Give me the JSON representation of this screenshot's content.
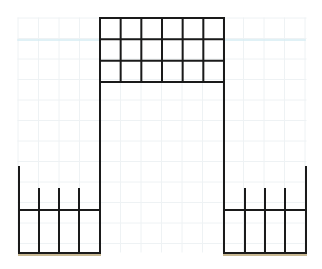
{
  "figure": {
    "colors": {
      "background": "#ffffff",
      "stroke": "#1a1a1a",
      "faint_grid": "#eef2f4",
      "guide_line": "#d6ecf3",
      "ground_line": "#c8b892"
    },
    "central_tower": {
      "x": 100,
      "y_top": 18,
      "x_right": 224,
      "y_bottom": 253,
      "grid_columns": 6,
      "grid_rows": 3,
      "grid_bottom": 82
    },
    "left_base": {
      "x_left": 19,
      "x_right": 100,
      "outer_post_top": 167,
      "inner_posts_x": [
        39,
        59,
        79
      ],
      "inner_posts_top": 189,
      "rail_y": 210,
      "bottom_y": 253
    },
    "right_base": {
      "x_left": 224,
      "x_right": 306,
      "outer_post_top": 167,
      "inner_posts_x": [
        245,
        265,
        285
      ],
      "inner_posts_top": 189,
      "rail_y": 210,
      "bottom_y": 253
    },
    "guide_line_y": 40
  }
}
